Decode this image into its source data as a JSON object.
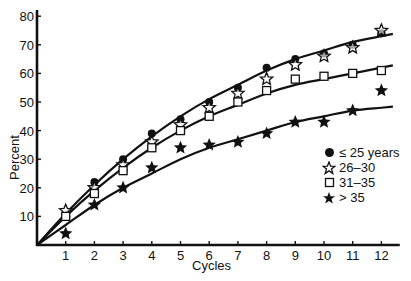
{
  "chart_data": {
    "type": "scatter",
    "title": "",
    "xlabel": "Cycles",
    "ylabel": "Percent",
    "x": [
      1,
      2,
      3,
      4,
      5,
      6,
      7,
      8,
      9,
      10,
      11,
      12
    ],
    "xlim": [
      0,
      12.5
    ],
    "ylim": [
      0,
      82
    ],
    "xticks": [
      1,
      2,
      3,
      4,
      5,
      6,
      7,
      8,
      9,
      10,
      11,
      12
    ],
    "yticks": [
      10,
      20,
      30,
      40,
      50,
      60,
      70,
      80
    ],
    "grid": false,
    "legend_position": "right-middle",
    "series": [
      {
        "name": "≤ 25 years",
        "marker": "filled-circle",
        "values": [
          10,
          22,
          30,
          39,
          44,
          50,
          55,
          62,
          65,
          67,
          70,
          74
        ]
      },
      {
        "name": "26–30",
        "marker": "open-star",
        "values": [
          12,
          20,
          28,
          36,
          42,
          48,
          53,
          58,
          63,
          66,
          69,
          75
        ]
      },
      {
        "name": "31–35",
        "marker": "open-square",
        "values": [
          10,
          18,
          26,
          34,
          40,
          45,
          50,
          54,
          58,
          59,
          60,
          61
        ]
      },
      {
        "name": "> 35",
        "marker": "filled-star",
        "values": [
          4,
          14,
          20,
          27,
          34,
          35,
          36,
          39,
          43,
          43,
          47,
          54
        ]
      }
    ],
    "fitted_curves": [
      {
        "name": "upper fit (≤ 25 years / 26–30)",
        "values": [
          11,
          21,
          30,
          38,
          45,
          51,
          56,
          61,
          65,
          68,
          71,
          73
        ]
      },
      {
        "name": "middle fit (31–35)",
        "values": [
          10,
          19,
          27,
          34,
          40,
          45,
          49,
          53,
          56,
          58,
          60,
          62
        ]
      },
      {
        "name": "lower fit (> 35)",
        "values": [
          7,
          14,
          20,
          25,
          30,
          34,
          37,
          40,
          43,
          45,
          47,
          48
        ]
      }
    ]
  },
  "legend": {
    "items": [
      {
        "label": "≤ 25 years",
        "icon": "filled-circle-icon"
      },
      {
        "label": "26–30",
        "icon": "open-star-icon"
      },
      {
        "label": "31–35",
        "icon": "open-square-icon"
      },
      {
        "label": "> 35",
        "icon": "filled-star-icon"
      }
    ]
  },
  "axes": {
    "x_label": "Cycles",
    "y_label": "Percent"
  }
}
